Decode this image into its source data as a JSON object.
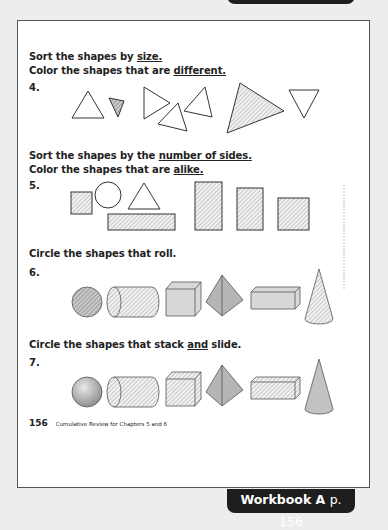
{
  "page": {
    "bottom_tab": {
      "book": "Workbook A",
      "page_ref": "p. 156"
    },
    "footer": {
      "page_number": "156",
      "text": "Cumulative Review for Chapters 5 and 6"
    }
  },
  "questions": [
    {
      "number": "4.",
      "instruction_line1": {
        "pre": "Sort the shapes by ",
        "key": "size.",
        "post": ""
      },
      "instruction_line2": {
        "pre": "Color the shapes that are ",
        "key": "different.",
        "post": ""
      },
      "shapes": [
        "triangle",
        "small-triangle-shaded",
        "triangle",
        "triangle",
        "triangle",
        "large-triangle-shaded",
        "triangle-inverted"
      ]
    },
    {
      "number": "5.",
      "instruction_line1": {
        "pre": "Sort the shapes by the ",
        "key": "number of sides.",
        "post": ""
      },
      "instruction_line2": {
        "pre": "Color the shapes that are ",
        "key": "alike.",
        "post": ""
      },
      "shapes": [
        "square-shaded",
        "circle",
        "triangle",
        "rectangle-shaded",
        "tall-rectangle-shaded",
        "rectangle-shaded",
        "square-shaded"
      ]
    },
    {
      "number": "6.",
      "instruction_line1": {
        "pre": "Circle the shapes that roll.",
        "key": "",
        "post": ""
      },
      "shapes": [
        "sphere",
        "cylinder",
        "cube",
        "pyramid",
        "rectangular-prism",
        "cone"
      ]
    },
    {
      "number": "7.",
      "instruction_line1": {
        "pre": "Circle the shapes that stack ",
        "key": "and",
        "post": " slide."
      },
      "shapes": [
        "sphere",
        "cylinder",
        "cube",
        "pyramid",
        "rectangular-prism",
        "cone"
      ]
    }
  ]
}
